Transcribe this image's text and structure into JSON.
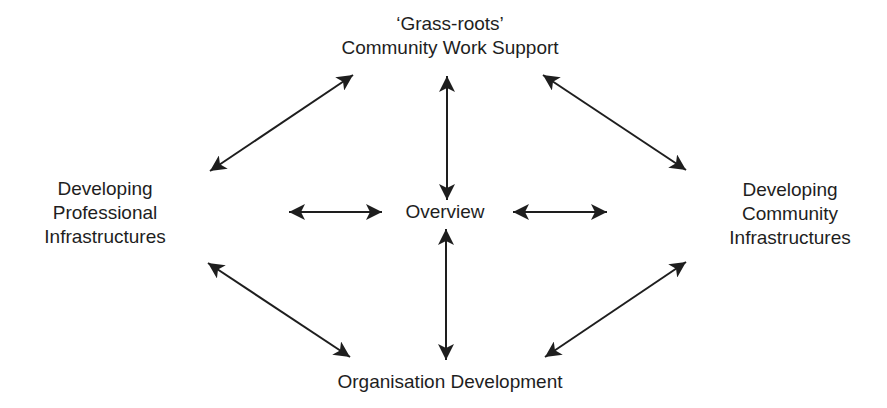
{
  "diagram": {
    "type": "hub-and-spoke",
    "colors": {
      "ink": "#1e1e1e",
      "background": "#ffffff"
    },
    "nodes": {
      "top": {
        "lines": [
          "‘Grass-roots’",
          "Community Work Support"
        ]
      },
      "left": {
        "lines": [
          "Developing",
          "Professional",
          "Infrastructures"
        ]
      },
      "right": {
        "lines": [
          "Developing",
          "Community",
          "Infrastructures"
        ]
      },
      "center": {
        "lines": [
          "Overview"
        ]
      },
      "bottom": {
        "lines": [
          "Organisation Development"
        ]
      }
    },
    "edges": [
      {
        "from": "top",
        "to": "center",
        "direction": "bidirectional"
      },
      {
        "from": "center",
        "to": "bottom",
        "direction": "bidirectional"
      },
      {
        "from": "left",
        "to": "center",
        "direction": "bidirectional"
      },
      {
        "from": "center",
        "to": "right",
        "direction": "bidirectional"
      },
      {
        "from": "left",
        "to": "top",
        "direction": "bidirectional"
      },
      {
        "from": "top",
        "to": "right",
        "direction": "bidirectional"
      },
      {
        "from": "left",
        "to": "bottom",
        "direction": "bidirectional"
      },
      {
        "from": "bottom",
        "to": "right",
        "direction": "bidirectional"
      }
    ]
  }
}
